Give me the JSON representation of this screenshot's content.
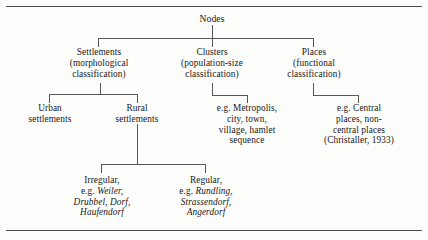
{
  "figure": {
    "title": "Nodes",
    "levels": {
      "root": "Nodes",
      "categories": [
        {
          "id": "settlements",
          "label": "Settlements\n(morphological\nclassification)"
        },
        {
          "id": "clusters",
          "label": "Clusters\n(population-size\nclassification)"
        },
        {
          "id": "places",
          "label": "Places\n(functional\nclassification)"
        }
      ],
      "settlement_types": [
        {
          "id": "urban",
          "label": "Urban\nsettlements"
        },
        {
          "id": "rural",
          "label": "Rural\nsettlements"
        }
      ],
      "rural_forms": [
        {
          "id": "irregular",
          "lead": "Irregular,",
          "eg_prefix": "e.g. ",
          "examples_italic_1": "Weiler,",
          "examples_italic_2": "Drubbel, Dorf,",
          "examples_italic_3": "Haufendorf"
        },
        {
          "id": "regular",
          "lead": "Regular,",
          "eg_prefix": "e.g. ",
          "examples_italic_1": "Rundling,",
          "examples_italic_2": "Strassendorf,",
          "examples_italic_3": "Angerdorf"
        }
      ],
      "cluster_examples": "e.g. Metropolis,\ncity, town,\nvillage, hamlet\nsequence",
      "place_examples": "e.g. Central\nplaces, non-\ncentral places\n(Christaller, 1933)"
    }
  },
  "colors": {
    "ink": "#171717",
    "line": "#585858",
    "rule": "#4a4a4a",
    "paper": "#fdfdfc"
  }
}
